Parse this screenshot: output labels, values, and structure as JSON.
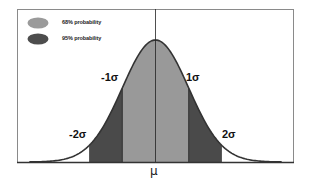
{
  "chart_data": {
    "type": "area",
    "distribution": "normal",
    "mean_label": "μ",
    "x_range_sigma": [
      -3.8,
      3.8
    ],
    "regions": [
      {
        "name": "68% probability",
        "from_sigma": -1,
        "to_sigma": 1,
        "color": "#999999",
        "probability": 0.68
      },
      {
        "name": "95% probability",
        "from_sigma": -2,
        "to_sigma": 2,
        "color": "#4a4a4a",
        "probability": 0.95
      }
    ],
    "boundary_labels": [
      "-2σ",
      "-1σ",
      "1σ",
      "2σ"
    ],
    "legend": [
      {
        "label": "68% probability",
        "color": "#999999"
      },
      {
        "label": "95% probability",
        "color": "#4a4a4a"
      }
    ],
    "legend_position": "top-left",
    "grid": false
  },
  "legend": {
    "items": [
      {
        "label": "68% probability"
      },
      {
        "label": "95% probability"
      }
    ]
  },
  "labels": {
    "minus_two_sigma": "-2σ",
    "minus_one_sigma": "-1σ",
    "one_sigma": "1σ",
    "two_sigma": "2σ",
    "mu": "μ"
  },
  "colors": {
    "inner": "#999999",
    "outer": "#4a4a4a",
    "curve": "#3a3a3a",
    "frame": "#777777"
  }
}
